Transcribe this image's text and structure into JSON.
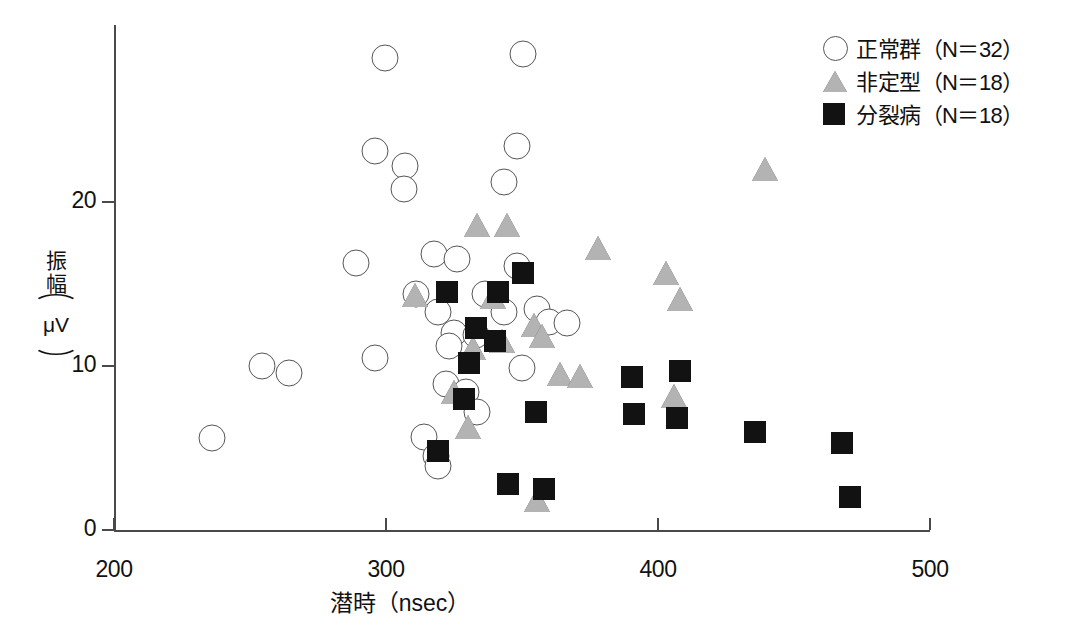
{
  "chart_data": {
    "type": "scatter",
    "title": "",
    "xlabel": "潜時（nsec）",
    "ylabel_parts": {
      "kanji": "振幅",
      "open_paren": "⌒",
      "unit": "μV",
      "close_paren": "⌒"
    },
    "ylabel": "振幅（μV）",
    "xlim": [
      200,
      500
    ],
    "ylim": [
      0,
      29
    ],
    "xticks": [
      200,
      300,
      400,
      500
    ],
    "yticks": [
      0,
      10,
      20
    ],
    "grid": false,
    "legend_position": "top-right",
    "series": [
      {
        "name": "正常群（N＝32）",
        "label": "正常群",
        "count_label": "（N＝32）",
        "n": 32,
        "marker": "circle",
        "fill": "#ffffff",
        "edge": "#555555",
        "points": [
          [
            299.5,
            28.8
          ],
          [
            350.2,
            29.0
          ],
          [
            296.1,
            23.1
          ],
          [
            307.0,
            22.2
          ],
          [
            348.0,
            23.4
          ],
          [
            306.5,
            20.8
          ],
          [
            343.5,
            21.2
          ],
          [
            289.0,
            16.3
          ],
          [
            317.5,
            16.8
          ],
          [
            326.0,
            16.5
          ],
          [
            348.2,
            16.1
          ],
          [
            311.0,
            14.4
          ],
          [
            319.0,
            13.3
          ],
          [
            336.5,
            14.4
          ],
          [
            343.5,
            13.3
          ],
          [
            355.5,
            13.5
          ],
          [
            360.0,
            12.7
          ],
          [
            366.5,
            12.6
          ],
          [
            325.0,
            12.0
          ],
          [
            333.0,
            11.9
          ],
          [
            296.0,
            10.5
          ],
          [
            254.5,
            10.0
          ],
          [
            264.5,
            9.6
          ],
          [
            323.0,
            11.2
          ],
          [
            350.0,
            9.9
          ],
          [
            322.0,
            8.9
          ],
          [
            329.5,
            8.4
          ],
          [
            333.5,
            7.2
          ],
          [
            314.0,
            5.7
          ],
          [
            318.5,
            4.5
          ],
          [
            236.0,
            5.6
          ],
          [
            319.0,
            3.9
          ]
        ]
      },
      {
        "name": "非定型（N＝18）",
        "label": "非定型",
        "count_label": "（N＝18）",
        "n": 18,
        "marker": "triangle",
        "fill": "#b3b3b3",
        "edge": "#555555",
        "points": [
          [
            439.5,
            22.0
          ],
          [
            333.5,
            18.6
          ],
          [
            344.5,
            18.6
          ],
          [
            378.0,
            17.2
          ],
          [
            403.0,
            15.7
          ],
          [
            408.0,
            14.1
          ],
          [
            310.5,
            14.3
          ],
          [
            339.5,
            14.2
          ],
          [
            354.5,
            12.5
          ],
          [
            357.5,
            11.8
          ],
          [
            342.5,
            11.5
          ],
          [
            332.0,
            11.1
          ],
          [
            364.0,
            9.5
          ],
          [
            371.5,
            9.4
          ],
          [
            325.0,
            8.4
          ],
          [
            406.0,
            8.2
          ],
          [
            330.0,
            6.3
          ],
          [
            355.5,
            1.8
          ]
        ]
      },
      {
        "name": "分裂病（N＝18）",
        "label": "分裂病",
        "count_label": "（N＝18）",
        "n": 18,
        "marker": "square",
        "fill": "#121212",
        "edge": "#121212",
        "points": [
          [
            322.5,
            14.5
          ],
          [
            341.0,
            14.5
          ],
          [
            350.5,
            15.7
          ],
          [
            333.0,
            12.3
          ],
          [
            340.0,
            11.5
          ],
          [
            330.5,
            10.2
          ],
          [
            390.5,
            9.3
          ],
          [
            408.0,
            9.7
          ],
          [
            328.5,
            8.0
          ],
          [
            391.0,
            7.1
          ],
          [
            407.0,
            6.8
          ],
          [
            355.0,
            7.2
          ],
          [
            435.5,
            6.0
          ],
          [
            467.5,
            5.3
          ],
          [
            319.0,
            4.8
          ],
          [
            345.0,
            2.8
          ],
          [
            358.0,
            2.5
          ],
          [
            470.5,
            2.0
          ]
        ]
      }
    ]
  },
  "axes": {
    "x_tick_labels": [
      "200",
      "300",
      "400",
      "500"
    ],
    "y_tick_labels": [
      "0",
      "10",
      "20"
    ],
    "x_title": "潜時（nsec）",
    "y_title_kanji": "振幅",
    "y_title_unit": "μV"
  },
  "legend": {
    "items": [
      {
        "marker": "circle-icon",
        "label": "正常群（N＝32）"
      },
      {
        "marker": "triangle-icon",
        "label": "非定型（N＝18）"
      },
      {
        "marker": "square-icon",
        "label": "分裂病（N＝18）"
      }
    ]
  }
}
